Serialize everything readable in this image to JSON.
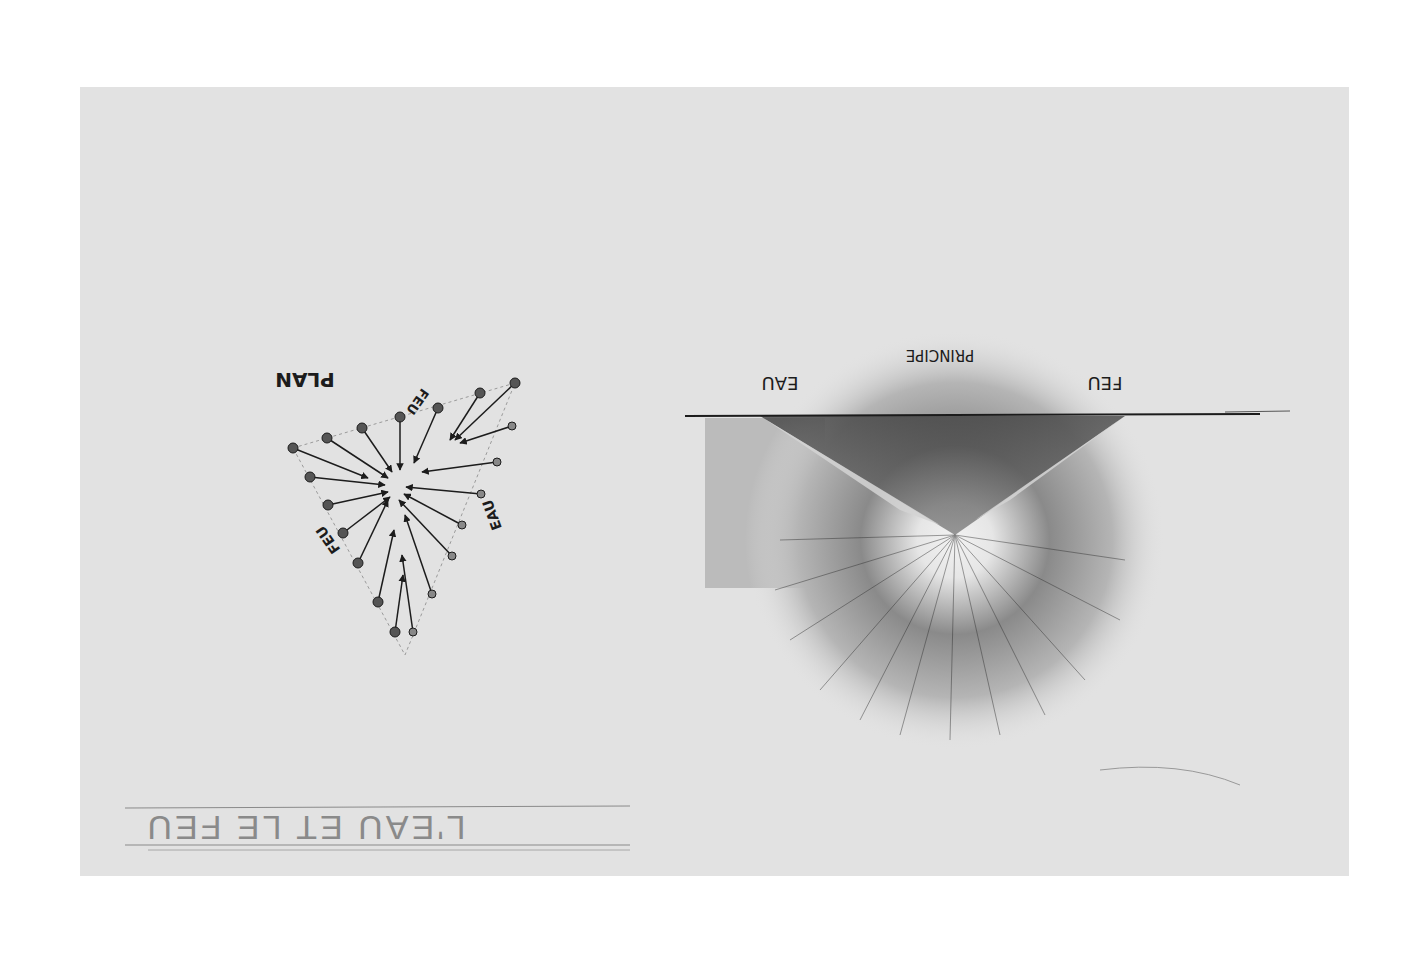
{
  "artwork": {
    "orientation": "rotated 180 degrees",
    "medium": "pencil drawing on grey paper",
    "paper_color": "#e2e2e2",
    "ink_color": "#1c1c1c",
    "title": "L'EAU ET LE FEU",
    "section": {
      "heading": "PRINCIPE",
      "left_label": "FEU",
      "right_label": "EAU"
    },
    "plan": {
      "heading": "PLAN",
      "labels": [
        "FEU",
        "EAU",
        "FEU"
      ]
    }
  }
}
